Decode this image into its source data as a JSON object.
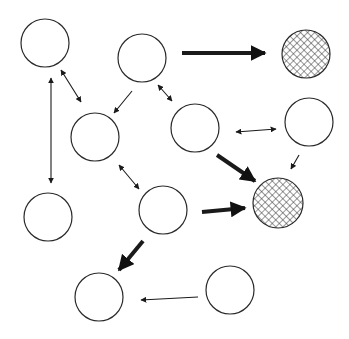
{
  "diagram": {
    "width": 349,
    "height": 339,
    "colors": {
      "stroke": "#2a2a2a",
      "hatch": "#333333",
      "background": "#ffffff"
    },
    "nodes": [
      {
        "id": "n1",
        "cx": 45,
        "cy": 43,
        "r": 24,
        "fill": "empty"
      },
      {
        "id": "n2",
        "cx": 142,
        "cy": 58,
        "r": 24,
        "fill": "empty"
      },
      {
        "id": "n3",
        "cx": 306,
        "cy": 54,
        "r": 24,
        "fill": "hatched"
      },
      {
        "id": "n4",
        "cx": 95,
        "cy": 137,
        "r": 24,
        "fill": "empty"
      },
      {
        "id": "n5",
        "cx": 195,
        "cy": 128,
        "r": 24,
        "fill": "empty"
      },
      {
        "id": "n6",
        "cx": 309,
        "cy": 122,
        "r": 24,
        "fill": "empty"
      },
      {
        "id": "n7",
        "cx": 48,
        "cy": 217,
        "r": 24,
        "fill": "empty"
      },
      {
        "id": "n8",
        "cx": 163,
        "cy": 210,
        "r": 24,
        "fill": "empty"
      },
      {
        "id": "n9",
        "cx": 278,
        "cy": 203,
        "r": 25,
        "fill": "hatched"
      },
      {
        "id": "n10",
        "cx": 99,
        "cy": 297,
        "r": 24,
        "fill": "empty"
      },
      {
        "id": "n11",
        "cx": 230,
        "cy": 290,
        "r": 24,
        "fill": "empty"
      }
    ],
    "edges": [
      {
        "from": "n2",
        "to": "n3",
        "x1": 182,
        "y1": 53,
        "x2": 265,
        "y2": 53,
        "weight": "thick",
        "direction": "forward"
      },
      {
        "from": "n1",
        "to": "n4",
        "x1": 61,
        "y1": 70,
        "x2": 81,
        "y2": 102,
        "weight": "thin",
        "direction": "both"
      },
      {
        "from": "n1",
        "to": "n7",
        "x1": 51,
        "y1": 78,
        "x2": 51,
        "y2": 183,
        "weight": "thin",
        "direction": "both"
      },
      {
        "from": "n2",
        "to": "n4",
        "x1": 132,
        "y1": 91,
        "x2": 114,
        "y2": 113,
        "weight": "thin",
        "direction": "forward"
      },
      {
        "from": "n2",
        "to": "n5",
        "x1": 158,
        "y1": 85,
        "x2": 172,
        "y2": 101,
        "weight": "thin",
        "direction": "both"
      },
      {
        "from": "n5",
        "to": "n6",
        "x1": 236,
        "y1": 132,
        "x2": 276,
        "y2": 129,
        "weight": "thin",
        "direction": "both"
      },
      {
        "from": "n6",
        "to": "n9",
        "x1": 299,
        "y1": 155,
        "x2": 291,
        "y2": 169,
        "weight": "thin",
        "direction": "forward"
      },
      {
        "from": "n5",
        "to": "n9",
        "x1": 217,
        "y1": 155,
        "x2": 255,
        "y2": 181,
        "weight": "thick",
        "direction": "forward"
      },
      {
        "from": "n4",
        "to": "n8",
        "x1": 119,
        "y1": 165,
        "x2": 139,
        "y2": 189,
        "weight": "thin",
        "direction": "both"
      },
      {
        "from": "n8",
        "to": "n9",
        "x1": 202,
        "y1": 212,
        "x2": 245,
        "y2": 208,
        "weight": "thick",
        "direction": "forward"
      },
      {
        "from": "n8",
        "to": "n10",
        "x1": 143,
        "y1": 241,
        "x2": 119,
        "y2": 270,
        "weight": "thick",
        "direction": "forward"
      },
      {
        "from": "n11",
        "to": "n10",
        "x1": 198,
        "y1": 297,
        "x2": 141,
        "y2": 300,
        "weight": "thin",
        "direction": "forward"
      }
    ]
  }
}
